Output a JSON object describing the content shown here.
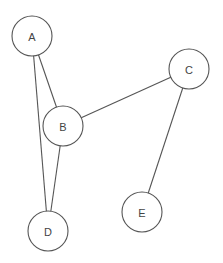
{
  "graph": {
    "nodes": [
      {
        "id": "A",
        "label": "A",
        "x": 32,
        "y": 36
      },
      {
        "id": "B",
        "label": "B",
        "x": 63,
        "y": 126
      },
      {
        "id": "C",
        "label": "C",
        "x": 189,
        "y": 69
      },
      {
        "id": "D",
        "label": "D",
        "x": 48,
        "y": 231
      },
      {
        "id": "E",
        "label": "E",
        "x": 142,
        "y": 212
      }
    ],
    "edges": [
      {
        "from": "A",
        "to": "B"
      },
      {
        "from": "A",
        "to": "D"
      },
      {
        "from": "B",
        "to": "D"
      },
      {
        "from": "B",
        "to": "C"
      },
      {
        "from": "C",
        "to": "E"
      }
    ],
    "node_radius": 20
  }
}
